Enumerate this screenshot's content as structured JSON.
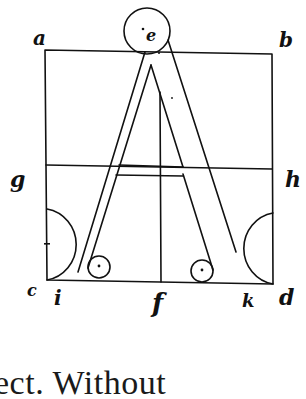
{
  "figure": {
    "colors": {
      "ink": "#111111",
      "paper": "#ffffff"
    },
    "labels": {
      "top_left": "a",
      "top_right": "b",
      "top_circle": "e",
      "mid_left": "g",
      "mid_right": "h",
      "bottom_left_corner": "c",
      "bottom_left_leg": "i",
      "bottom_middle": "f",
      "bottom_right_leg": "k",
      "bottom_right_corner": "d"
    }
  },
  "caption": {
    "text": "ect. Without"
  }
}
